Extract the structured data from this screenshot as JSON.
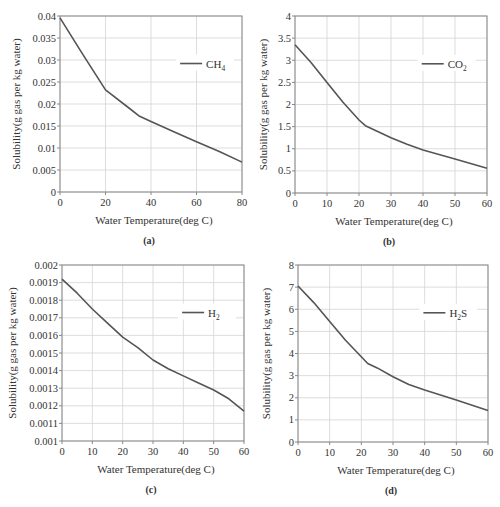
{
  "figure": {
    "caption": ""
  },
  "chart_data": [
    {
      "id": "a",
      "type": "line",
      "panel_label": "(a)",
      "title": "",
      "xlabel": "Water Temperature(deg C)",
      "ylabel": "Solubility(g gas per kg water)",
      "legend": "CH4",
      "legend_html": {
        "base": "CH",
        "sub": "4"
      },
      "legend_position": "upper right",
      "grid": true,
      "xlim": [
        0,
        80
      ],
      "ylim": [
        0,
        0.04
      ],
      "xticks": [
        0,
        20,
        40,
        60,
        80
      ],
      "xtick_labels": [
        "0",
        "20",
        "40",
        "60",
        "80"
      ],
      "yticks": [
        0,
        0.005,
        0.01,
        0.015,
        0.02,
        0.025,
        0.03,
        0.035,
        0.04
      ],
      "ytick_labels": [
        "0",
        "0.005",
        "0.01",
        "0.015",
        "0.02",
        "0.025",
        "0.03",
        "0.035",
        "0.04"
      ],
      "x": [
        0,
        10,
        20,
        30,
        35,
        40,
        50,
        60,
        70,
        80
      ],
      "series": [
        {
          "name": "CH4",
          "values": [
            0.0396,
            0.0313,
            0.0232,
            0.0192,
            0.0172,
            0.016,
            0.0137,
            0.0114,
            0.0092,
            0.0068
          ]
        }
      ],
      "layout": {
        "left": 60,
        "top": 16,
        "right": 242,
        "bottom": 192
      }
    },
    {
      "id": "b",
      "type": "line",
      "panel_label": "(b)",
      "title": "",
      "xlabel": "Water Temperature(deg C)",
      "ylabel": "Solubility(g gas per kg water)",
      "legend": "CO2",
      "legend_html": {
        "base": "CO",
        "sub": "2"
      },
      "legend_position": "upper right",
      "grid": true,
      "xlim": [
        0,
        60
      ],
      "ylim": [
        0,
        4
      ],
      "xticks": [
        0,
        10,
        20,
        30,
        40,
        50,
        60
      ],
      "xtick_labels": [
        "0",
        "10",
        "20",
        "30",
        "40",
        "50",
        "60"
      ],
      "yticks": [
        0,
        0.5,
        1,
        1.5,
        2,
        2.5,
        3,
        3.5,
        4
      ],
      "ytick_labels": [
        "0",
        "0.5",
        "1",
        "1.5",
        "2",
        "2.5",
        "3",
        "3.5",
        "4"
      ],
      "x": [
        0,
        5,
        10,
        15,
        20,
        22,
        25,
        30,
        35,
        40,
        50,
        60
      ],
      "series": [
        {
          "name": "CO2",
          "values": [
            3.35,
            2.95,
            2.5,
            2.05,
            1.65,
            1.52,
            1.42,
            1.25,
            1.1,
            0.97,
            0.77,
            0.56
          ]
        }
      ],
      "layout": {
        "left": 295,
        "top": 16,
        "right": 487,
        "bottom": 193
      }
    },
    {
      "id": "c",
      "type": "line",
      "panel_label": "(c)",
      "title": "",
      "xlabel": "Water Temperature(deg C)",
      "ylabel": "Solubility(g gas per kg water)",
      "legend": "H2",
      "legend_html": {
        "base": "H",
        "sub": "2"
      },
      "legend_position": "upper right",
      "grid": true,
      "xlim": [
        0,
        60
      ],
      "ylim": [
        0.001,
        0.002
      ],
      "xticks": [
        0,
        10,
        20,
        30,
        40,
        50,
        60
      ],
      "xtick_labels": [
        "0",
        "10",
        "20",
        "30",
        "40",
        "50",
        "60"
      ],
      "yticks": [
        0.001,
        0.0011,
        0.0012,
        0.0013,
        0.0014,
        0.0015,
        0.0016,
        0.0017,
        0.0018,
        0.0019,
        0.002
      ],
      "ytick_labels": [
        "0.001",
        "0.0011",
        "0.0012",
        "0.0013",
        "0.0014",
        "0.0015",
        "0.0016",
        "0.0017",
        "0.0018",
        "0.0019",
        "0.002"
      ],
      "x": [
        0,
        5,
        10,
        15,
        20,
        25,
        30,
        35,
        40,
        45,
        50,
        55,
        60
      ],
      "series": [
        {
          "name": "H2",
          "values": [
            0.00192,
            0.00184,
            0.00175,
            0.00167,
            0.00159,
            0.00153,
            0.00146,
            0.00141,
            0.00137,
            0.00133,
            0.00129,
            0.00124,
            0.00117
          ]
        }
      ],
      "layout": {
        "left": 62,
        "top": 265,
        "right": 244,
        "bottom": 441
      }
    },
    {
      "id": "d",
      "type": "line",
      "panel_label": "(d)",
      "title": "",
      "xlabel": "Water Temperature(deg C)",
      "ylabel": "Solubility(g gas per kg water)",
      "legend": "H2S",
      "legend_html": {
        "base": "H",
        "sub": "2",
        "tail": "S"
      },
      "legend_position": "upper right",
      "grid": true,
      "xlim": [
        0,
        60
      ],
      "ylim": [
        0,
        8
      ],
      "xticks": [
        0,
        10,
        20,
        30,
        40,
        50,
        60
      ],
      "xtick_labels": [
        "0",
        "10",
        "20",
        "30",
        "40",
        "50",
        "60"
      ],
      "yticks": [
        0,
        1,
        2,
        3,
        4,
        5,
        6,
        7,
        8
      ],
      "ytick_labels": [
        "0",
        "1",
        "2",
        "3",
        "4",
        "5",
        "6",
        "7",
        "8"
      ],
      "x": [
        0,
        5,
        10,
        15,
        20,
        22,
        25,
        30,
        35,
        40,
        50,
        60
      ],
      "series": [
        {
          "name": "H2S",
          "values": [
            7.05,
            6.3,
            5.45,
            4.6,
            3.85,
            3.55,
            3.35,
            2.95,
            2.6,
            2.35,
            1.9,
            1.42
          ]
        }
      ],
      "layout": {
        "left": 298,
        "top": 265,
        "right": 488,
        "bottom": 442
      }
    }
  ],
  "style": {
    "line_color": "#555555",
    "grid_color": "#d4d4d4",
    "axis_color": "#888888",
    "text_color": "#333333"
  }
}
